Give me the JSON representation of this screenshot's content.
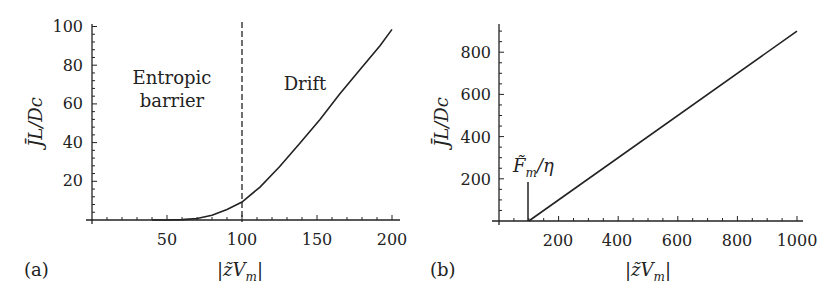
{
  "chart_data": [
    {
      "panel": "(a)",
      "type": "line",
      "xlabel": "|z̃V_m|",
      "ylabel": "J̄L/Dc",
      "xlim": [
        0,
        205
      ],
      "ylim": [
        0,
        100
      ],
      "xticks": [
        50,
        100,
        150,
        200
      ],
      "yticks": [
        20,
        40,
        60,
        80,
        100
      ],
      "grid": false,
      "legend": null,
      "annotations": [
        {
          "text": "Entropic barrier",
          "region": "left of dashed line"
        },
        {
          "text": "Drift",
          "region": "right of dashed line"
        }
      ],
      "vertical_dashed_line_x": 100,
      "series": [
        {
          "name": "J̄L/Dc",
          "x": [
            40,
            50,
            60,
            70,
            80,
            90,
            100,
            112,
            125,
            139,
            152,
            165,
            179,
            192,
            200
          ],
          "y": [
            0,
            0,
            0.2,
            0.8,
            2.5,
            5.5,
            9.3,
            17,
            27.5,
            40,
            52,
            65,
            78,
            90,
            98.5
          ]
        }
      ]
    },
    {
      "panel": "(b)",
      "type": "line",
      "xlabel": "|z̃V_m|",
      "ylabel": "J̄L/Dc",
      "xlim": [
        0,
        1000
      ],
      "ylim": [
        0,
        930
      ],
      "xticks": [
        200,
        400,
        600,
        800,
        1000
      ],
      "yticks": [
        200,
        400,
        600,
        800
      ],
      "grid": false,
      "legend": null,
      "annotations": [
        {
          "text": "F̃_m/η",
          "x": 100,
          "marker": "vertical line at threshold"
        }
      ],
      "series": [
        {
          "name": "J̄L/Dc",
          "x": [
            100,
            1000
          ],
          "y": [
            0,
            900
          ]
        }
      ]
    }
  ],
  "panels": {
    "a": {
      "label": "(a)",
      "ylabel": "J̄L/Dc",
      "xlabel_prefix": "|z̃V",
      "xlabel_sub": "m",
      "xlabel_suffix": "|",
      "annotation_left_line1": "Entropic",
      "annotation_left_line2": "barrier",
      "annotation_right": "Drift",
      "xtick_labels": [
        "50",
        "100",
        "150",
        "200"
      ],
      "ytick_labels": [
        "20",
        "40",
        "60",
        "80",
        "100"
      ]
    },
    "b": {
      "label": "(b)",
      "ylabel": "J̄L/Dc",
      "xlabel_prefix": "|z̃V",
      "xlabel_sub": "m",
      "xlabel_suffix": "|",
      "threshold_label_main": "F̃",
      "threshold_label_sub": "m",
      "threshold_label_suffix": "/η",
      "xtick_labels": [
        "200",
        "400",
        "600",
        "800",
        "1000"
      ],
      "ytick_labels": [
        "200",
        "400",
        "600",
        "800"
      ]
    }
  },
  "colors": {
    "line": "#222222",
    "background": "#ffffff"
  }
}
